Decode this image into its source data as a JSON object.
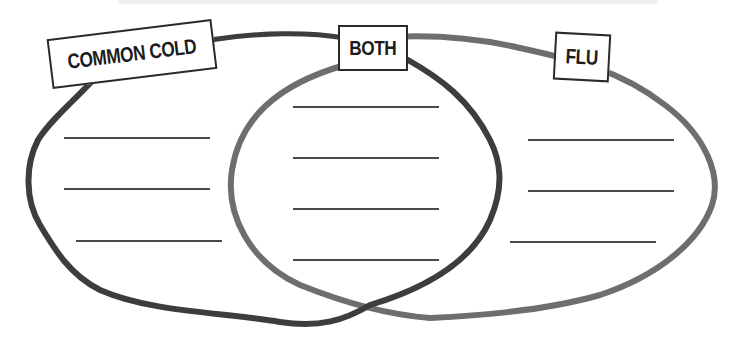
{
  "diagram": {
    "type": "venn",
    "labels": {
      "left": "COMMON COLD",
      "middle": "BOTH",
      "right": "FLU"
    },
    "colors": {
      "left_circle": "#3d3d3d",
      "right_circle": "#6e6e6e",
      "label_border": "#2a2a2a",
      "write_line": "#4a4a4a",
      "background": "#ffffff"
    },
    "regions": {
      "left": {
        "blank_lines": 3
      },
      "middle": {
        "blank_lines": 4
      },
      "right": {
        "blank_lines": 3
      }
    }
  }
}
